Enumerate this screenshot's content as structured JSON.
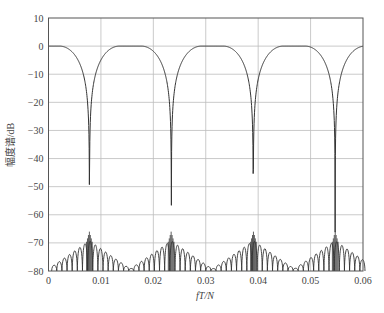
{
  "chart_data": {
    "type": "line",
    "title": "",
    "xlabel": "fT/N",
    "ylabel": "幅度谱/dB",
    "xlim": [
      0,
      0.06
    ],
    "ylim": [
      -80,
      10
    ],
    "xticks": [
      0,
      0.01,
      0.02,
      0.03,
      0.04,
      0.05,
      0.06
    ],
    "xtick_labels": [
      "0",
      "0.01",
      "0.02",
      "0.03",
      "0.04",
      "0.05",
      "0.06"
    ],
    "yticks": [
      10,
      0,
      -10,
      -20,
      -30,
      -40,
      -50,
      -60,
      -70,
      -80
    ],
    "ytick_labels": [
      "10",
      "0",
      "−10",
      "−20",
      "−30",
      "−40",
      "−50",
      "−60",
      "−70",
      "−80"
    ],
    "grid": true,
    "legend": null,
    "series": [
      {
        "name": "magnitude spectrum",
        "description": "Periodic raised-cosine-like passbands (0 dB) with period 0.015625, deep nulls at ~0.0078, 0.0234, 0.0391, 0.0547 and sidelobe floor between -66 dB and -80 dB",
        "period": 0.015625,
        "passband_centers": [
          0,
          0.015625,
          0.03125,
          0.046875,
          0.0625
        ],
        "null_centers": [
          0.0078,
          0.0234,
          0.0391,
          0.0547
        ],
        "x": [
          0,
          0.002,
          0.004,
          0.006,
          0.007,
          0.0078,
          0.0086,
          0.0096,
          0.0116,
          0.0136,
          0.0156,
          0.0176,
          0.0196,
          0.0216,
          0.0226,
          0.0234,
          0.0242,
          0.0252,
          0.0272,
          0.0292,
          0.0312,
          0.0332,
          0.0352,
          0.0372,
          0.0382,
          0.0391,
          0.04,
          0.041,
          0.043,
          0.045,
          0.0469,
          0.0489,
          0.0509,
          0.0529,
          0.0539,
          0.0547,
          0.0555,
          0.0565,
          0.0585,
          0.06
        ],
        "values": [
          0,
          0,
          -4,
          -18,
          -35,
          -66,
          -35,
          -18,
          -4,
          0,
          0,
          0,
          -4,
          -18,
          -35,
          -66,
          -35,
          -18,
          -4,
          0,
          0,
          0,
          -4,
          -18,
          -35,
          -66,
          -35,
          -18,
          -4,
          0,
          0,
          0,
          -4,
          -18,
          -35,
          -66,
          -35,
          -18,
          -4,
          0
        ],
        "sidelobe_peaks_db": [
          -78,
          -77,
          -75,
          -73,
          -70,
          -66,
          -66,
          -70,
          -73,
          -75,
          -77,
          -78,
          -79
        ]
      }
    ]
  },
  "axes": {
    "x_label_italic": "fT/N",
    "y_label": "幅度谱/dB"
  },
  "colors": {
    "curve": "#333333",
    "grid": "#bdbdbd",
    "frame": "#555555",
    "text": "#444444"
  }
}
